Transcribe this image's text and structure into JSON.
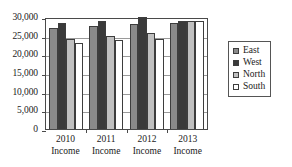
{
  "chart_data": {
    "type": "bar",
    "title": "",
    "subtitle": "",
    "xlabel": "",
    "ylabel": "",
    "ylim": [
      0,
      30000
    ],
    "yticks": [
      0,
      5000,
      10000,
      15000,
      20000,
      25000,
      30000
    ],
    "ytick_labels": [
      "0",
      "5,000",
      "10,000",
      "15,000",
      "20,000",
      "25,000",
      "30,000"
    ],
    "grid": true,
    "legend_position": "right",
    "categories": [
      "2010 Income",
      "2011 Income",
      "2012 Income",
      "2013 Income"
    ],
    "category_lines": [
      [
        "2010",
        "Income"
      ],
      [
        "2011",
        "Income"
      ],
      [
        "2012",
        "Income"
      ],
      [
        "2013",
        "Income"
      ]
    ],
    "series": [
      {
        "name": "East",
        "color": "#8a8a8a",
        "values": [
          27000,
          27500,
          28000,
          28500
        ]
      },
      {
        "name": "West",
        "color": "#3a3a3a",
        "values": [
          28500,
          29000,
          30000,
          29000
        ]
      },
      {
        "name": "North",
        "color": "#c0c0c0",
        "values": [
          24000,
          25000,
          25800,
          29000
        ]
      },
      {
        "name": "South",
        "color": "#ffffff",
        "values": [
          23000,
          23800,
          24100,
          29000
        ]
      }
    ]
  },
  "legend": {
    "items": [
      {
        "label": "East"
      },
      {
        "label": "West"
      },
      {
        "label": "North"
      },
      {
        "label": "South"
      }
    ]
  }
}
